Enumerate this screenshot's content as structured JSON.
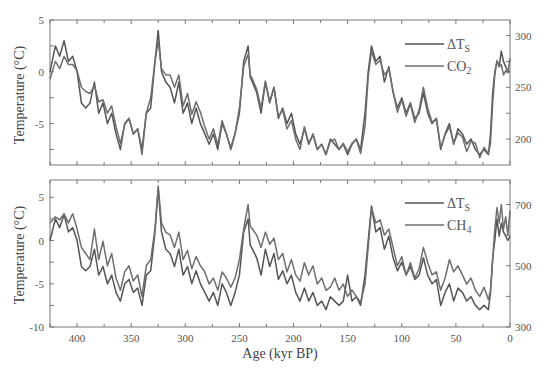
{
  "chart_data": [
    {
      "type": "line",
      "panel": "top",
      "title": "",
      "xlabel": "Age (kyr BP)",
      "ylabel": "Temperature (°C)",
      "y2label": "",
      "xlim": [
        425,
        0
      ],
      "ylim": [
        -9,
        5
      ],
      "y2lim": [
        175,
        315
      ],
      "xticks": [
        400,
        350,
        300,
        250,
        200,
        150,
        100,
        50,
        0
      ],
      "yticks": [
        5,
        0,
        -5
      ],
      "y2ticks": [
        300,
        250,
        200
      ],
      "grid": false,
      "legend_position": "upper right",
      "legend": [
        "ΔTS",
        "CO2"
      ],
      "series": [
        {
          "name": "ΔTS",
          "axis": "left",
          "x": [
            425,
            420,
            416,
            412,
            408,
            404,
            400,
            396,
            392,
            388,
            384,
            380,
            376,
            372,
            368,
            364,
            360,
            356,
            352,
            348,
            344,
            340,
            336,
            332,
            328,
            325,
            322,
            318,
            314,
            310,
            306,
            302,
            298,
            294,
            290,
            286,
            282,
            278,
            274,
            270,
            266,
            262,
            258,
            254,
            250,
            246,
            242,
            240,
            238,
            234,
            230,
            226,
            222,
            218,
            214,
            210,
            206,
            202,
            198,
            194,
            190,
            186,
            182,
            178,
            174,
            170,
            166,
            162,
            158,
            154,
            150,
            146,
            142,
            138,
            134,
            131,
            128,
            124,
            120,
            116,
            112,
            108,
            104,
            100,
            96,
            92,
            88,
            84,
            80,
            76,
            72,
            68,
            64,
            60,
            56,
            52,
            48,
            44,
            40,
            36,
            32,
            28,
            24,
            20,
            18,
            16,
            14,
            12,
            10,
            8,
            6,
            4,
            2,
            0
          ],
          "y": [
            0,
            2.5,
            1.5,
            3,
            1,
            1.5,
            0,
            -3,
            -3.5,
            -3,
            -1,
            -4,
            -3,
            -5,
            -4,
            -6,
            -7.5,
            -5,
            -4.5,
            -6,
            -5.5,
            -7.5,
            -4,
            -3.5,
            1,
            4,
            0,
            -1,
            -1.5,
            -3,
            -1,
            -4,
            -3,
            -5,
            -3.5,
            -5,
            -6,
            -7,
            -6,
            -7.5,
            -5,
            -6,
            -7.5,
            -6,
            -4,
            1,
            2.5,
            -0.5,
            -1,
            -2,
            -4,
            -1,
            -3,
            -1.5,
            -4.5,
            -3.5,
            -5,
            -4,
            -6,
            -7,
            -5.5,
            -7,
            -6,
            -7.5,
            -7,
            -8,
            -6.5,
            -7,
            -7.5,
            -7,
            -8,
            -7,
            -6.5,
            -7.5,
            -4,
            0,
            2.5,
            1,
            1.5,
            -1,
            0.5,
            -2,
            -3.5,
            -2.5,
            -4,
            -3,
            -4.5,
            -4,
            -2,
            -4,
            -5,
            -4.5,
            -7.5,
            -6,
            -5,
            -7,
            -5.5,
            -6,
            -7,
            -6.5,
            -7.5,
            -8,
            -7.5,
            -8,
            -6,
            -2,
            0,
            1,
            0.5,
            2,
            1,
            0.5,
            0,
            0
          ]
        },
        {
          "name": "CO2",
          "axis": "right",
          "unit": "ppmv",
          "x": [
            425,
            420,
            416,
            412,
            408,
            404,
            400,
            396,
            392,
            388,
            384,
            380,
            376,
            372,
            368,
            364,
            360,
            356,
            352,
            348,
            344,
            340,
            336,
            332,
            328,
            325,
            322,
            318,
            314,
            310,
            306,
            302,
            298,
            294,
            290,
            286,
            282,
            278,
            274,
            270,
            266,
            262,
            258,
            254,
            250,
            246,
            242,
            240,
            238,
            234,
            230,
            226,
            222,
            218,
            214,
            210,
            206,
            202,
            198,
            194,
            190,
            186,
            182,
            178,
            174,
            170,
            166,
            162,
            158,
            154,
            150,
            146,
            142,
            138,
            134,
            131,
            128,
            124,
            120,
            116,
            112,
            108,
            104,
            100,
            96,
            92,
            88,
            84,
            80,
            76,
            72,
            68,
            64,
            60,
            56,
            52,
            48,
            44,
            40,
            36,
            32,
            28,
            24,
            20,
            18,
            16,
            14,
            12,
            10,
            8,
            6,
            4,
            2,
            0
          ],
          "y": [
            258,
            275,
            268,
            280,
            272,
            272,
            266,
            250,
            246,
            244,
            252,
            236,
            238,
            225,
            232,
            212,
            196,
            214,
            220,
            205,
            210,
            185,
            225,
            240,
            275,
            295,
            268,
            262,
            262,
            250,
            262,
            232,
            244,
            224,
            236,
            226,
            212,
            200,
            210,
            194,
            218,
            205,
            192,
            206,
            230,
            270,
            282,
            262,
            258,
            248,
            230,
            256,
            236,
            250,
            222,
            228,
            210,
            218,
            200,
            190,
            212,
            196,
            204,
            190,
            195,
            185,
            198,
            200,
            190,
            196,
            188,
            196,
            200,
            186,
            212,
            260,
            285,
            272,
            276,
            262,
            268,
            246,
            226,
            238,
            222,
            234,
            216,
            228,
            250,
            230,
            216,
            220,
            192,
            204,
            212,
            196,
            206,
            202,
            188,
            198,
            196,
            182,
            192,
            186,
            196,
            235,
            262,
            276,
            270,
            272,
            262,
            266,
            264,
            278
          ]
        }
      ]
    },
    {
      "type": "line",
      "panel": "bottom",
      "title": "",
      "xlabel": "Age (kyr BP)",
      "ylabel": "Temperature (°C)",
      "xlim": [
        425,
        0
      ],
      "ylim": [
        -10,
        7
      ],
      "y2lim": [
        300,
        780
      ],
      "xticks": [
        400,
        350,
        300,
        250,
        200,
        150,
        100,
        50,
        0
      ],
      "yticks": [
        5,
        0,
        -5,
        -10
      ],
      "y2ticks": [
        700,
        500,
        300
      ],
      "grid": false,
      "legend_position": "upper right",
      "legend": [
        "ΔTS",
        "CH4"
      ],
      "series": [
        {
          "name": "ΔTS",
          "axis": "left",
          "x": [
            425,
            420,
            416,
            412,
            408,
            404,
            400,
            396,
            392,
            388,
            384,
            380,
            376,
            372,
            368,
            364,
            360,
            356,
            352,
            348,
            344,
            340,
            336,
            332,
            328,
            325,
            322,
            318,
            314,
            310,
            306,
            302,
            298,
            294,
            290,
            286,
            282,
            278,
            274,
            270,
            266,
            262,
            258,
            254,
            250,
            246,
            242,
            240,
            238,
            234,
            230,
            226,
            222,
            218,
            214,
            210,
            206,
            202,
            198,
            194,
            190,
            186,
            182,
            178,
            174,
            170,
            166,
            162,
            158,
            154,
            150,
            146,
            142,
            138,
            134,
            131,
            128,
            124,
            120,
            116,
            112,
            108,
            104,
            100,
            96,
            92,
            88,
            84,
            80,
            76,
            72,
            68,
            64,
            60,
            56,
            52,
            48,
            44,
            40,
            36,
            32,
            28,
            24,
            20,
            18,
            16,
            14,
            12,
            10,
            8,
            6,
            4,
            2,
            0
          ],
          "y": [
            0,
            2.5,
            1.5,
            3,
            1,
            1.5,
            0,
            -3,
            -3.5,
            -3,
            -1,
            -4,
            -3,
            -5,
            -4,
            -6,
            -7,
            -5,
            -4.5,
            -6,
            -5.5,
            -7.5,
            -4,
            -3.5,
            1,
            6,
            1,
            -1,
            -1.5,
            -3,
            -1,
            -4,
            -3,
            -5,
            -3.5,
            -5,
            -6,
            -7,
            -6,
            -7.5,
            -5,
            -6,
            -7.5,
            -6,
            -4,
            1,
            2.5,
            -0.5,
            -1,
            -2,
            -4,
            -1,
            -3,
            -1.5,
            -4.5,
            -3.5,
            -5,
            -4,
            -6,
            -7,
            -5.5,
            -7,
            -6,
            -7.5,
            -7,
            -8,
            -6.5,
            -7,
            -7.5,
            -7,
            -4,
            -7,
            -6.5,
            -7.5,
            -4,
            0,
            4,
            1,
            1.5,
            -1,
            0.5,
            -2,
            -3.5,
            -2.5,
            -4,
            -3,
            -4.5,
            -4,
            -2,
            -4,
            -5,
            -4.5,
            -7.5,
            -6,
            -5,
            -7,
            -5.5,
            -6,
            -7,
            -6.5,
            -7.5,
            -8,
            -7.5,
            -8,
            -6,
            -2,
            0,
            2.5,
            0.5,
            2,
            1,
            0.5,
            0,
            0.5
          ]
        },
        {
          "name": "CH4",
          "axis": "right",
          "unit": "ppbv",
          "x": [
            425,
            420,
            416,
            412,
            408,
            404,
            400,
            396,
            392,
            388,
            384,
            380,
            376,
            372,
            368,
            364,
            360,
            356,
            352,
            348,
            344,
            340,
            336,
            332,
            328,
            325,
            322,
            318,
            314,
            310,
            306,
            302,
            298,
            294,
            290,
            286,
            282,
            278,
            274,
            270,
            266,
            262,
            258,
            254,
            250,
            246,
            242,
            240,
            238,
            234,
            230,
            226,
            222,
            218,
            214,
            210,
            206,
            202,
            198,
            194,
            190,
            186,
            182,
            178,
            174,
            170,
            166,
            162,
            158,
            154,
            150,
            146,
            142,
            138,
            134,
            131,
            128,
            124,
            120,
            116,
            112,
            108,
            104,
            100,
            96,
            92,
            88,
            84,
            80,
            76,
            72,
            68,
            64,
            60,
            56,
            52,
            48,
            44,
            40,
            36,
            32,
            28,
            24,
            20,
            18,
            16,
            14,
            12,
            10,
            8,
            6,
            4,
            2,
            0
          ],
          "y": [
            640,
            660,
            650,
            670,
            640,
            670,
            620,
            560,
            540,
            520,
            620,
            520,
            580,
            500,
            540,
            460,
            420,
            480,
            500,
            450,
            470,
            400,
            500,
            520,
            620,
            760,
            640,
            610,
            600,
            560,
            610,
            520,
            550,
            490,
            530,
            500,
            480,
            440,
            460,
            420,
            480,
            460,
            430,
            460,
            520,
            620,
            700,
            630,
            620,
            600,
            560,
            610,
            570,
            590,
            520,
            540,
            480,
            520,
            470,
            450,
            510,
            470,
            500,
            440,
            460,
            420,
            430,
            460,
            420,
            440,
            400,
            420,
            400,
            380,
            440,
            560,
            690,
            640,
            650,
            600,
            620,
            560,
            500,
            530,
            470,
            510,
            460,
            490,
            560,
            510,
            470,
            480,
            420,
            460,
            520,
            480,
            500,
            470,
            440,
            460,
            420,
            400,
            430,
            390,
            420,
            520,
            620,
            690,
            640,
            700,
            620,
            660,
            600,
            680
          ]
        }
      ]
    }
  ],
  "labels": {
    "top_ylabel": "Temperature (°C)",
    "bottom_ylabel": "Temperature (°C)",
    "xlabel": "Age (kyr BP)",
    "top_legend_1": "ΔT",
    "top_legend_1_sub": "S",
    "top_legend_2": "CO",
    "top_legend_2_sub": "2",
    "bottom_legend_1": "ΔT",
    "bottom_legend_1_sub": "S",
    "bottom_legend_2": "CH",
    "bottom_legend_2_sub": "4"
  },
  "colors": {
    "line": "#555555",
    "line_alt": "#6e6e6e",
    "axis": "#666666"
  }
}
